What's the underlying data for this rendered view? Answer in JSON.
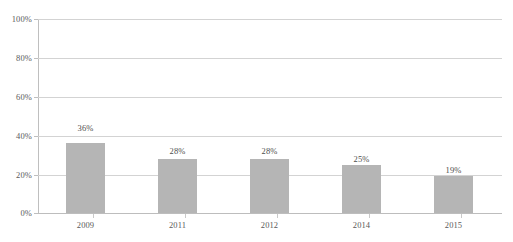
{
  "chart_data": {
    "type": "bar",
    "title": "",
    "subtitle": "",
    "xlabel": "",
    "ylabel": "",
    "categories": [
      "2009",
      "2011",
      "2012",
      "2014",
      "2015"
    ],
    "values": [
      36,
      28,
      28,
      25,
      19
    ],
    "value_labels": [
      "36%",
      "28%",
      "28%",
      "25%",
      "19%"
    ],
    "ylim": [
      0,
      100
    ],
    "ytick_values": [
      0,
      20,
      40,
      60,
      80,
      100
    ],
    "ytick_labels": [
      "0%",
      "20%",
      "40%",
      "60%",
      "80%",
      "100%"
    ],
    "grid": true,
    "grid_axis": "y",
    "legend": false,
    "legend_position": "none",
    "series": [
      {
        "name": "",
        "values": [
          36,
          28,
          28,
          25,
          19
        ]
      }
    ]
  },
  "style": {
    "bar_color": "#b5b5b5",
    "gridline_color": "#d3d3d3",
    "axis_color": "#bfbfbf",
    "tick_label_color": "#5a5a5a",
    "value_label_color": "#4d4d4d",
    "background_color": "#ffffff"
  }
}
